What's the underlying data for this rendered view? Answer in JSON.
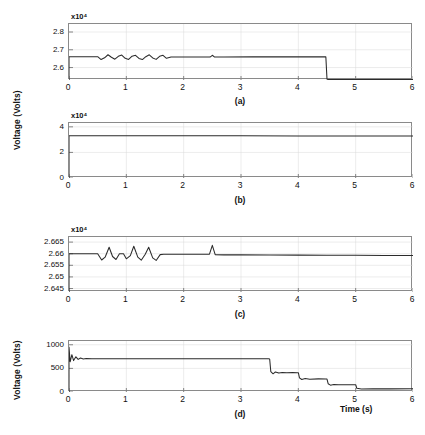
{
  "figure": {
    "ylabel_top": "Voltage (Volts)",
    "ylabel_bottom": "Voltage (Volts)",
    "xlabel": "Time (s)",
    "exponent_label": "x10⁴",
    "captions": {
      "a": "(a)",
      "b": "(b)",
      "c": "(c)",
      "d": "(d)"
    },
    "trace_color": "#2b2b2b",
    "axis_color": "#8a8a8a",
    "grid_color": "#d8d8d8"
  },
  "chart_data": [
    {
      "type": "line",
      "panel": "(a)",
      "title": "",
      "xlabel": "",
      "ylabel": "Voltage (Volts)",
      "y_exponent": "x10⁴",
      "y_scale": 10000,
      "xlim": [
        0,
        6
      ],
      "ylim": [
        2.53,
        2.845
      ],
      "xticks": [
        0,
        1,
        2,
        3,
        4,
        5,
        6
      ],
      "xticklabels": [
        "0",
        "1",
        "2",
        "3",
        "4",
        "5",
        "6"
      ],
      "yticks": [
        2.6,
        2.7,
        2.8
      ],
      "yticklabels": [
        "2.6",
        "2.7",
        "2.8"
      ],
      "grid": true,
      "series": [
        {
          "name": "DC link voltage",
          "x": [
            0,
            0.0,
            0.04,
            0.5,
            0.56,
            0.62,
            0.68,
            0.74,
            0.8,
            0.86,
            0.92,
            0.98,
            1.04,
            1.1,
            1.16,
            1.22,
            1.28,
            1.34,
            1.4,
            1.46,
            1.52,
            1.58,
            1.64,
            1.7,
            1.78,
            1.85,
            2.2,
            2.46,
            2.5,
            2.54,
            2.7,
            3.2,
            3.7,
            4.2,
            4.48,
            4.5,
            4.52,
            5.0,
            5.5,
            6.0
          ],
          "y": [
            2.53,
            2.661,
            2.661,
            2.661,
            2.645,
            2.655,
            2.672,
            2.658,
            2.647,
            2.663,
            2.67,
            2.652,
            2.646,
            2.664,
            2.669,
            2.651,
            2.645,
            2.661,
            2.672,
            2.654,
            2.646,
            2.663,
            2.669,
            2.652,
            2.659,
            2.659,
            2.659,
            2.659,
            2.669,
            2.659,
            2.659,
            2.66,
            2.66,
            2.66,
            2.66,
            2.535,
            2.532,
            2.532,
            2.533,
            2.532
          ]
        }
      ]
    },
    {
      "type": "line",
      "panel": "(b)",
      "title": "",
      "xlabel": "",
      "ylabel": "Voltage (Volts)",
      "y_exponent": "x10⁴",
      "y_scale": 10000,
      "xlim": [
        0,
        6
      ],
      "ylim": [
        0,
        4.3
      ],
      "xticks": [
        0,
        1,
        2,
        3,
        4,
        5,
        6
      ],
      "xticklabels": [
        "0",
        "1",
        "2",
        "3",
        "4",
        "5",
        "6"
      ],
      "yticks": [
        0,
        2,
        4
      ],
      "yticklabels": [
        "0",
        "2",
        "4"
      ],
      "grid": true,
      "series": [
        {
          "name": "Grid voltage",
          "x": [
            0,
            0.0,
            0.02,
            1.0,
            2.0,
            3.0,
            4.0,
            5.0,
            6.0
          ],
          "y": [
            0,
            3.3,
            3.31,
            3.31,
            3.3,
            3.3,
            3.29,
            3.29,
            3.28
          ]
        }
      ]
    },
    {
      "type": "line",
      "panel": "(c)",
      "title": "",
      "xlabel": "",
      "ylabel": "Voltage (Volts)",
      "y_exponent": "x10⁴",
      "y_scale": 10000,
      "xlim": [
        0,
        6
      ],
      "ylim": [
        2.6435,
        2.6672
      ],
      "xticks": [
        0,
        1,
        2,
        3,
        4,
        5,
        6
      ],
      "xticklabels": [
        "0",
        "1",
        "2",
        "3",
        "4",
        "5",
        "6"
      ],
      "yticks": [
        2.645,
        2.65,
        2.655,
        2.66,
        2.665
      ],
      "yticklabels": [
        "2.645",
        "2.65",
        "2.655",
        "2.66",
        "2.665"
      ],
      "grid": true,
      "series": [
        {
          "name": "Capacitor voltage",
          "x": [
            0,
            0.0,
            0.05,
            0.5,
            0.57,
            0.63,
            0.7,
            0.76,
            0.82,
            0.88,
            0.95,
            1.0,
            1.07,
            1.13,
            1.2,
            1.26,
            1.33,
            1.39,
            1.46,
            1.52,
            1.59,
            1.65,
            1.72,
            1.78,
            2.1,
            2.45,
            2.5,
            2.55,
            2.7,
            3.0,
            3.5,
            4.0,
            4.5,
            5.0,
            5.5,
            6.0
          ],
          "y": [
            2.6435,
            2.66,
            2.66,
            2.66,
            2.6573,
            2.6585,
            2.6628,
            2.6588,
            2.6575,
            2.66,
            2.66,
            2.6578,
            2.6592,
            2.6632,
            2.6585,
            2.6572,
            2.6598,
            2.6628,
            2.6582,
            2.6571,
            2.6596,
            2.6598,
            2.6598,
            2.6598,
            2.6598,
            2.6598,
            2.6636,
            2.6596,
            2.6595,
            2.6595,
            2.6594,
            2.6594,
            2.6593,
            2.6593,
            2.6592,
            2.6592
          ]
        }
      ]
    },
    {
      "type": "line",
      "panel": "(d)",
      "title": "",
      "xlabel": "Time (s)",
      "ylabel": "Voltage (Volts)",
      "y_exponent": "",
      "y_scale": 1,
      "xlim": [
        0,
        6
      ],
      "ylim": [
        0,
        1080
      ],
      "xticks": [
        0,
        1,
        2,
        3,
        4,
        5,
        6
      ],
      "xticklabels": [
        "0",
        "1",
        "2",
        "3",
        "4",
        "5",
        "6"
      ],
      "yticks": [
        0,
        500,
        1000
      ],
      "yticklabels": [
        "0",
        "500",
        "1000"
      ],
      "grid": true,
      "series": [
        {
          "name": "Output voltage",
          "x": [
            0,
            0.0,
            0.02,
            0.05,
            0.08,
            0.12,
            0.16,
            0.2,
            0.25,
            0.3,
            0.4,
            0.6,
            1.0,
            1.5,
            2.0,
            2.5,
            3.0,
            3.48,
            3.5,
            3.52,
            3.56,
            3.6,
            3.66,
            3.72,
            3.8,
            3.9,
            3.98,
            4.0,
            4.02,
            4.06,
            4.12,
            4.2,
            4.35,
            4.48,
            4.5,
            4.52,
            4.56,
            4.62,
            4.7,
            4.85,
            4.98,
            5.0,
            5.02,
            5.1,
            5.3,
            5.6,
            6.0
          ],
          "y": [
            0,
            950,
            640,
            790,
            665,
            745,
            690,
            720,
            700,
            710,
            705,
            706,
            706,
            706,
            705,
            705,
            704,
            703,
            700,
            430,
            385,
            425,
            400,
            415,
            408,
            410,
            409,
            408,
            300,
            265,
            285,
            272,
            278,
            276,
            275,
            175,
            145,
            160,
            152,
            155,
            154,
            153,
            80,
            62,
            70,
            66,
            68
          ]
        }
      ]
    }
  ]
}
